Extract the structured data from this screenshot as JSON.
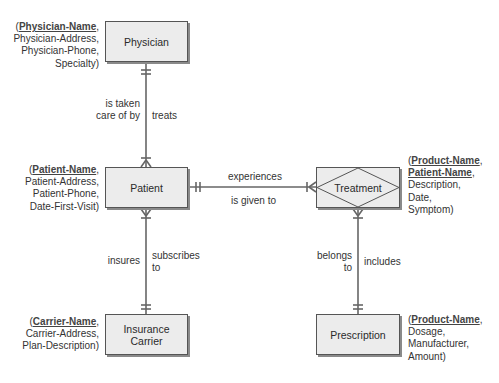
{
  "entities": {
    "physician": {
      "label": "Physician"
    },
    "patient": {
      "label": "Patient"
    },
    "insurance_carrier": {
      "label_line1": "Insurance",
      "label_line2": "Carrier"
    },
    "treatment": {
      "label": "Treatment"
    },
    "prescription": {
      "label": "Prescription"
    }
  },
  "attributes": {
    "physician": {
      "open": "(",
      "key": "Physician-Name",
      "keysep": ",",
      "rest": [
        "Physician-Address,",
        "Physician-Phone,",
        "Specialty)"
      ]
    },
    "patient": {
      "open": "(",
      "key": "Patient-Name",
      "keysep": ",",
      "rest": [
        "Patient-Address,",
        "Patient-Phone,",
        "Date-First-Visit)"
      ]
    },
    "insurance_carrier": {
      "open": "(",
      "key": "Carrier-Name",
      "keysep": ",",
      "rest": [
        "Carrier-Address,",
        "Plan-Description)"
      ]
    },
    "treatment": {
      "open": "(",
      "key1": "Product-Name",
      "key2": "Patient-Name",
      "keysep": ",",
      "rest": [
        "Description,",
        "Date,",
        "Symptom)"
      ]
    },
    "prescription": {
      "open": "(",
      "key": "Product-Name",
      "keysep": ",",
      "rest": [
        "Dosage,",
        "Manufacturer,",
        "Amount)"
      ]
    }
  },
  "relationships": {
    "physician_patient": {
      "left_line1": "is taken",
      "left_line2": "care of by",
      "right": "treats"
    },
    "patient_treatment": {
      "top": "experiences",
      "bottom": "is given to"
    },
    "patient_carrier": {
      "left": "insures",
      "right_line1": "subscribes",
      "right_line2": "to"
    },
    "treatment_prescription": {
      "left_line1": "belongs",
      "left_line2": "to",
      "right": "includes"
    }
  }
}
